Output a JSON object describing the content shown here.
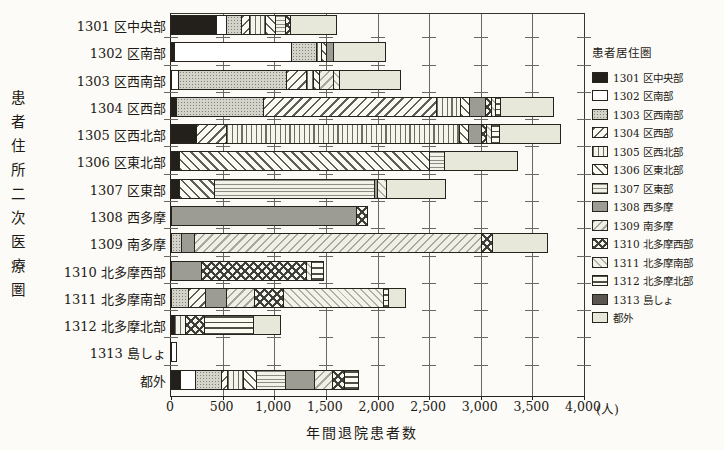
{
  "figure": {
    "y_axis_title": "患者住所二次医療圏",
    "x_axis_title": "年間退院患者数",
    "legend_title": "患者居住圏",
    "x_unit": "(人)"
  },
  "chart_data": {
    "type": "bar",
    "orientation": "horizontal",
    "stacked": true,
    "title": "",
    "xlabel": "年間退院患者数",
    "ylabel": "患者住所二次医療圏",
    "legend_title": "患者居住圏",
    "legend_position": "right",
    "grid": true,
    "xlim": [
      0,
      4000
    ],
    "x_ticks": [
      "0",
      "500",
      "1,000",
      "1,500",
      "2,000",
      "2,500",
      "3,000",
      "3,500",
      "4,000"
    ],
    "x_unit": "(人)",
    "categories": [
      "1301 区中央部",
      "1302 区南部",
      "1303 区西南部",
      "1304 区西部",
      "1305 区西北部",
      "1306 区東北部",
      "1307 区東部",
      "1308 西多摩",
      "1309 南多摩",
      "1310 北多摩西部",
      "1311 北多摩南部",
      "1312 北多摩北部",
      "1313 島しょ",
      "都外"
    ],
    "series": [
      {
        "id": "s01",
        "label": "1301 区中央部",
        "pattern": "solid-black",
        "color": "#231f1a",
        "values": [
          435,
          25,
          0,
          50,
          240,
          80,
          80,
          0,
          0,
          0,
          0,
          30,
          0,
          90
        ]
      },
      {
        "id": "s02",
        "label": "1302 区南部",
        "pattern": "solid-white",
        "color": "#ffffff",
        "values": [
          95,
          1140,
          70,
          0,
          0,
          0,
          0,
          0,
          0,
          0,
          0,
          0,
          40,
          140
        ]
      },
      {
        "id": "s03",
        "label": "1303 区西南部",
        "pattern": "gray-dots",
        "color": "#d3d3ca",
        "values": [
          145,
          240,
          1045,
          840,
          0,
          0,
          0,
          0,
          100,
          0,
          165,
          0,
          0,
          250
        ]
      },
      {
        "id": "s04",
        "label": "1304 区西部",
        "pattern": "diagonal-up-hatch",
        "color": "#5f5f5a",
        "values": [
          80,
          0,
          195,
          1680,
          290,
          0,
          0,
          0,
          0,
          0,
          160,
          0,
          0,
          60
        ]
      },
      {
        "id": "s05",
        "label": "1305 区西北部",
        "pattern": "vertical-lines",
        "color": "#6d6d66",
        "values": [
          160,
          50,
          70,
          225,
          2260,
          0,
          0,
          0,
          0,
          0,
          0,
          110,
          0,
          160
        ]
      },
      {
        "id": "s06",
        "label": "1306 区東北部",
        "pattern": "diagonal-down-hatch",
        "color": "#5f5f5a",
        "values": [
          95,
          50,
          55,
          90,
          90,
          2420,
          340,
          0,
          0,
          0,
          0,
          0,
          0,
          120
        ]
      },
      {
        "id": "s07",
        "label": "1307 区東部",
        "pattern": "horizontal-lines-fine",
        "color": "#8c8c82",
        "values": [
          95,
          0,
          0,
          0,
          0,
          145,
          1550,
          0,
          0,
          0,
          0,
          0,
          0,
          280
        ]
      },
      {
        "id": "s08",
        "label": "1308 西多摩",
        "pattern": "solid-gray",
        "color": "#9c9c94",
        "values": [
          0,
          65,
          0,
          155,
          125,
          0,
          30,
          1790,
          120,
          290,
          210,
          0,
          0,
          290
        ]
      },
      {
        "id": "s09",
        "label": "1309 南多摩",
        "pattern": "diagonal-up-fine",
        "color": "#a8a89e",
        "values": [
          0,
          0,
          135,
          0,
          0,
          0,
          0,
          0,
          2780,
          0,
          270,
          0,
          0,
          170
        ]
      },
      {
        "id": "s10",
        "label": "1310 北多摩西部",
        "pattern": "crosshatch",
        "color": "#3f3f3a",
        "values": [
          50,
          0,
          0,
          55,
          50,
          0,
          0,
          100,
          105,
          1020,
          280,
          175,
          0,
          120
        ]
      },
      {
        "id": "s11",
        "label": "1311 北多摩南部",
        "pattern": "diagonal-down-fine",
        "color": "#b0b0a6",
        "values": [
          0,
          0,
          55,
          45,
          45,
          0,
          85,
          0,
          0,
          45,
          970,
          0,
          0,
          0
        ]
      },
      {
        "id": "s12",
        "label": "1312 北多摩北部",
        "pattern": "horizontal-lines-wide",
        "color": "#504d47",
        "values": [
          0,
          0,
          0,
          45,
          75,
          0,
          0,
          0,
          0,
          110,
          50,
          480,
          0,
          120
        ]
      },
      {
        "id": "s13",
        "label": "1313 島しょ",
        "pattern": "solid-darkgray",
        "color": "#5a564f",
        "values": [
          0,
          0,
          0,
          0,
          0,
          0,
          0,
          0,
          0,
          0,
          0,
          0,
          0,
          0
        ]
      },
      {
        "id": "s14",
        "label": "都外",
        "pattern": "solid-lightgray",
        "color": "#e8e8da",
        "values": [
          435,
          495,
          580,
          505,
          580,
          700,
          560,
          0,
          525,
          0,
          155,
          255,
          0,
          0
        ]
      }
    ]
  }
}
